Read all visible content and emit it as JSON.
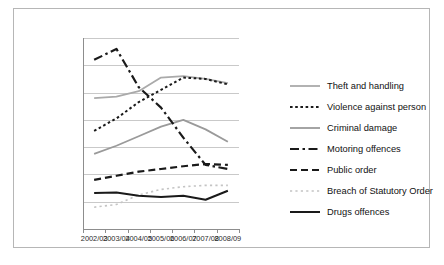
{
  "chart_data": {
    "type": "line",
    "title": "",
    "xlabel": "",
    "ylabel": "",
    "categories": [
      "2002/03",
      "2003/04",
      "2004/05",
      "2005/06",
      "2006/07",
      "2007/08",
      "2008/09"
    ],
    "ylim": [
      0,
      70000
    ],
    "ytick_labels": [
      "0",
      "10,000",
      "20,000",
      "30,000",
      "40,000",
      "50,000",
      "60,000",
      "70,000"
    ],
    "ytick_values": [
      0,
      10000,
      20000,
      30000,
      40000,
      50000,
      60000,
      70000
    ],
    "grid": true,
    "legend_position": "right",
    "series": [
      {
        "name": "Theft and handling",
        "style": "solid",
        "color": "#aaaaaa",
        "width": 1.8,
        "values": [
          48000,
          48500,
          50500,
          55500,
          56000,
          55000,
          53500
        ]
      },
      {
        "name": "Violence against person",
        "style": "dotted",
        "color": "#1a1a1a",
        "width": 2.0,
        "values": [
          36000,
          40500,
          46500,
          51000,
          55500,
          55000,
          53000
        ]
      },
      {
        "name": "Criminal damage",
        "style": "solid",
        "color": "#9a9a9a",
        "width": 1.8,
        "values": [
          27500,
          30500,
          34000,
          37500,
          40000,
          36500,
          32000
        ]
      },
      {
        "name": "Motoring offences",
        "style": "dashdot",
        "color": "#1a1a1a",
        "width": 2.2,
        "values": [
          62000,
          66000,
          52000,
          44500,
          33500,
          23500,
          22000
        ]
      },
      {
        "name": "Public order",
        "style": "dashed",
        "color": "#1a1a1a",
        "width": 2.2,
        "values": [
          18000,
          19500,
          21000,
          22000,
          23000,
          23800,
          23500
        ]
      },
      {
        "name": "Breach of Statutory Order",
        "style": "dotted-light",
        "color": "#c4c4c4",
        "width": 1.6,
        "values": [
          8000,
          9000,
          12500,
          14500,
          15500,
          16000,
          16000
        ]
      },
      {
        "name": "Drugs offences",
        "style": "solid",
        "color": "#1a1a1a",
        "width": 2.0,
        "values": [
          13200,
          13400,
          12200,
          11700,
          12200,
          10700,
          14000
        ]
      }
    ]
  },
  "figure": {
    "caption": ""
  }
}
